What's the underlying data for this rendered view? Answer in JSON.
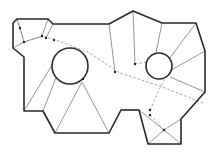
{
  "diagram": {
    "width": 218,
    "height": 152,
    "colors": {
      "background": "#ffffff",
      "outline": "#2a2a2a",
      "triangulation": "#6a6a6a",
      "path": "#8a8a8a",
      "node": "#222222"
    },
    "outer_polygon": "13,23 17,19 48,19 53,24 109,24 133,11 162,23 196,23 205,51 205,92 181,119 181,144 148,144 139,110 121,110 109,133 55,133 43,111 24,111 24,57 13,48",
    "holes": [
      {
        "name": "left-circle-obstacle",
        "cx": 70,
        "cy": 66,
        "r": 18
      },
      {
        "name": "right-circle-obstacle",
        "cx": 159,
        "cy": 66,
        "r": 13
      }
    ],
    "triangulation_edges": [
      [
        17,
        19,
        20,
        28
      ],
      [
        20,
        28,
        24,
        42
      ],
      [
        24,
        42,
        13,
        48
      ],
      [
        24,
        42,
        43,
        36
      ],
      [
        48,
        19,
        42,
        36
      ],
      [
        53,
        24,
        46,
        38
      ],
      [
        109,
        24,
        115,
        72
      ],
      [
        133,
        11,
        135,
        64
      ],
      [
        162,
        23,
        156,
        53
      ],
      [
        196,
        23,
        166,
        63
      ],
      [
        205,
        51,
        171,
        70
      ],
      [
        205,
        92,
        170,
        77
      ],
      [
        24,
        111,
        60,
        52
      ],
      [
        43,
        111,
        66,
        52
      ],
      [
        55,
        133,
        82,
        82
      ],
      [
        109,
        133,
        82,
        82
      ],
      [
        148,
        144,
        164,
        130
      ],
      [
        181,
        144,
        164,
        130
      ],
      [
        181,
        119,
        164,
        130
      ],
      [
        139,
        110,
        164,
        130
      ],
      [
        121,
        110,
        139,
        110
      ],
      [
        109,
        133,
        121,
        110
      ]
    ],
    "dashed_path": [
      [
        17,
        19
      ],
      [
        24,
        42
      ],
      [
        42,
        36
      ],
      [
        56,
        40
      ],
      [
        88,
        52
      ],
      [
        120,
        73
      ],
      [
        160,
        86
      ],
      [
        205,
        104
      ]
    ],
    "dashed_path_2": [
      [
        135,
        64
      ],
      [
        170,
        58
      ]
    ],
    "dashed_path_3": [
      [
        150,
        110
      ],
      [
        158,
        92
      ],
      [
        165,
        78
      ]
    ],
    "dashed_path_4": [
      [
        150,
        115
      ],
      [
        164,
        130
      ]
    ],
    "nodes": [
      [
        20,
        28
      ],
      [
        24,
        42
      ],
      [
        42,
        36
      ],
      [
        46,
        38
      ],
      [
        54,
        40
      ],
      [
        83,
        79
      ],
      [
        115,
        72
      ],
      [
        135,
        64
      ],
      [
        150,
        110
      ],
      [
        150,
        115
      ],
      [
        164,
        130
      ]
    ]
  }
}
